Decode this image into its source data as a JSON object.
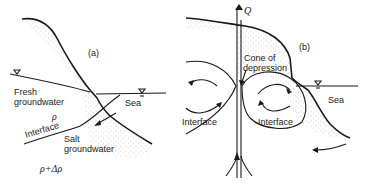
{
  "panel_a": {
    "label": "(a)",
    "fresh_groundwater_line1": "Fresh",
    "fresh_groundwater_line2": "groundwater",
    "rho": "ρ",
    "interface": "Interface",
    "salt_groundwater_line1": "Salt",
    "salt_groundwater_line2": "groundwater",
    "rho_plus_delta": "ρ+Δρ",
    "sea": "Sea"
  },
  "panel_b": {
    "label": "(b)",
    "q": "Q",
    "cone_line1": "Cone of",
    "cone_line2": "depression",
    "interface_left": "Interface",
    "interface_right": "Interface",
    "sea": "Sea"
  },
  "icons": [
    "water-table-triangle-icon",
    "flow-arrow-icon"
  ],
  "colors": {
    "ink": "#1a1a1a",
    "stipple": "#8a8a8a",
    "background": "#ffffff"
  }
}
